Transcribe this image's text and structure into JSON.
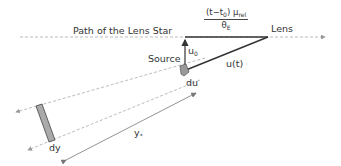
{
  "diagram": {
    "labels": {
      "path": "Path of the Lens Star",
      "lens": "Lens",
      "source": "Source",
      "u0_main": "u",
      "u0_sub": "0",
      "ut": "u(t)",
      "du": "du",
      "dy": "dy",
      "ystar_main": "y",
      "ystar_sub": "*"
    },
    "fraction": {
      "num_prefix": "(t−t",
      "num_sub0": "0",
      "num_mid": ") μ",
      "num_sub_rel": "rel",
      "den_main": "θ",
      "den_sub": "E"
    },
    "colors": {
      "line": "#333333",
      "dashed": "#aaaaaa",
      "detector_fill": "#aaaaaa",
      "text": "#333333"
    }
  }
}
